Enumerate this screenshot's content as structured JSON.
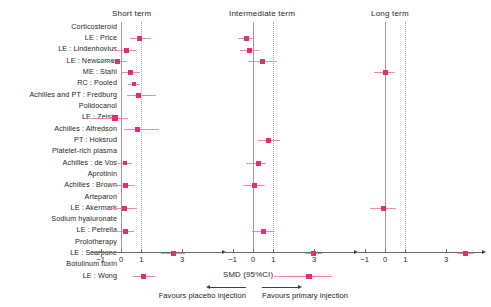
{
  "chart_data": {
    "type": "scatter",
    "plot_kind": "forest-plot",
    "title": "",
    "xlabel": "SMD  (95%CI)",
    "ylabel": "",
    "xlim": [
      -1.6,
      4.6
    ],
    "xticks": [
      -1,
      0,
      1,
      3
    ],
    "xtick_labels": [
      "−1",
      "0",
      "1",
      "3"
    ],
    "grid": false,
    "reference_lines": [
      {
        "value": 0,
        "style": "solid"
      },
      {
        "value": 1,
        "style": "dotted"
      }
    ],
    "legend_position": "none",
    "marker_color": "#e2316a",
    "ci_color": "#f08aa8",
    "panels": [
      {
        "label": "Short term"
      },
      {
        "label": "Intermediate term"
      },
      {
        "label": "Long term"
      }
    ],
    "categories": [
      "Corticosteroid",
      "LE : Price",
      "LE : Lindenhovius",
      "LE : Newcomer",
      "ME : Stahl",
      "RC : Pooled",
      "Achilles and PT : Fredburg",
      "Polidocanol",
      "LE : Zeisig",
      "Achilles : Alfredson",
      "PT : Hoksrud",
      "Platelet-rich plasma",
      "Achilles : de Vos",
      "Aprotinin",
      "Achilles : Brown",
      "Arteparon",
      "LE : Akermark",
      "Sodium hyaluronate",
      "LE : Petrella",
      "Prolotherapy",
      "LE : Scarpone",
      "Botulinum toxin",
      "LE : Wong"
    ],
    "rows": [
      {
        "label": "Corticosteroid",
        "heading": true,
        "short": null,
        "intermediate": null,
        "long": null
      },
      {
        "label": "LE : Price",
        "heading": false,
        "short": {
          "smd": 0.9,
          "lo": 0.45,
          "hi": 1.45
        },
        "intermediate": {
          "smd": -0.3,
          "lo": -0.75,
          "hi": 0.05
        },
        "long": null
      },
      {
        "label": "LE : Lindenhovius",
        "heading": false,
        "short": {
          "smd": 0.25,
          "lo": -0.35,
          "hi": 0.75
        },
        "intermediate": {
          "smd": -0.15,
          "lo": -0.65,
          "hi": 0.3
        },
        "long": null
      },
      {
        "label": "LE : Newcomer",
        "heading": false,
        "short": {
          "smd": -0.15,
          "lo": -1.3,
          "hi": 0.3
        },
        "intermediate": {
          "smd": 0.45,
          "lo": -0.25,
          "hi": 1.2
        },
        "long": null
      },
      {
        "label": "ME : Stahl",
        "heading": false,
        "short": {
          "smd": 0.45,
          "lo": 0.05,
          "hi": 0.95
        },
        "intermediate": null,
        "long": {
          "smd": 0.0,
          "lo": -0.55,
          "hi": 0.5
        }
      },
      {
        "label": "RC : Pooled",
        "heading": false,
        "short": {
          "smd": 0.65,
          "lo": 0.35,
          "hi": 0.95
        },
        "intermediate": null,
        "long": null
      },
      {
        "label": "Achilles and PT : Fredburg",
        "heading": false,
        "short": {
          "smd": 0.85,
          "lo": 0.3,
          "hi": 1.7
        },
        "intermediate": null,
        "long": null
      },
      {
        "label": "Polidocanol",
        "heading": true,
        "short": null,
        "intermediate": null,
        "long": null
      },
      {
        "label": "LE : Zeisig",
        "heading": false,
        "short": {
          "smd": -0.3,
          "lo": -1.6,
          "hi": 0.35
        },
        "intermediate": null,
        "long": null
      },
      {
        "label": "Achilles : Alfredson",
        "heading": false,
        "short": {
          "smd": 0.8,
          "lo": 0.15,
          "hi": 1.85
        },
        "intermediate": null,
        "long": null
      },
      {
        "label": "PT : Hoksrud",
        "heading": false,
        "short": null,
        "intermediate": {
          "smd": 0.75,
          "lo": 0.25,
          "hi": 1.3
        },
        "long": null
      },
      {
        "label": "Platelet-rich plasma",
        "heading": true,
        "short": null,
        "intermediate": null,
        "long": null
      },
      {
        "label": "Achilles : de Vos",
        "heading": false,
        "short": {
          "smd": 0.2,
          "lo": -0.15,
          "hi": 0.55
        },
        "intermediate": {
          "smd": 0.25,
          "lo": -0.35,
          "hi": 0.65
        },
        "long": null
      },
      {
        "label": "Aprotinin",
        "heading": true,
        "short": null,
        "intermediate": null,
        "long": null
      },
      {
        "label": "Achilles : Brown",
        "heading": false,
        "short": {
          "smd": 0.2,
          "lo": -0.5,
          "hi": 0.7
        },
        "intermediate": {
          "smd": 0.05,
          "lo": -0.5,
          "hi": 0.6
        },
        "long": null
      },
      {
        "label": "Arteparon",
        "heading": true,
        "short": null,
        "intermediate": null,
        "long": null
      },
      {
        "label": "LE : Akermark",
        "heading": false,
        "short": {
          "smd": 0.15,
          "lo": -0.6,
          "hi": 0.8
        },
        "intermediate": null,
        "long": {
          "smd": -0.05,
          "lo": -0.75,
          "hi": 0.55
        }
      },
      {
        "label": "Sodium hyaluronate",
        "heading": true,
        "short": null,
        "intermediate": null,
        "long": null
      },
      {
        "label": "LE : Petrella",
        "heading": false,
        "short": {
          "smd": 0.2,
          "lo": -0.25,
          "hi": 0.65
        },
        "intermediate": {
          "smd": 0.5,
          "lo": -0.05,
          "hi": 1.1
        },
        "long": null
      },
      {
        "label": "Prolotherapy",
        "heading": true,
        "short": null,
        "intermediate": null,
        "long": null
      },
      {
        "label": "LE : Scarpone",
        "heading": false,
        "short": {
          "smd": 2.55,
          "lo": 1.95,
          "hi": 3.15
        },
        "intermediate": {
          "smd": 2.95,
          "lo": 2.55,
          "hi": 3.4
        },
        "long": {
          "smd": 3.95,
          "lo": 3.55,
          "hi": 4.35
        }
      },
      {
        "label": "Botulinum toxin",
        "heading": true,
        "short": null,
        "intermediate": null,
        "long": null
      },
      {
        "label": "LE : Wong",
        "heading": false,
        "short": {
          "smd": 1.1,
          "lo": 0.6,
          "hi": 1.65
        },
        "intermediate": {
          "smd": 2.75,
          "lo": 1.05,
          "hi": 3.85
        },
        "long": null
      }
    ]
  },
  "axis": {
    "smd_caption": "SMD  (95%CI)",
    "favours_placebo": "Favours placebo injection",
    "favours_primary": "Favours primary injection"
  },
  "panel_titles": {
    "short": "Short term",
    "intermediate": "Intermediate term",
    "long": "Long term"
  }
}
